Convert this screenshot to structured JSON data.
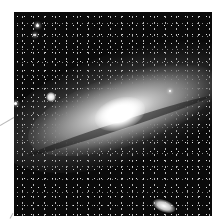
{
  "image": {
    "subject": "Andromeda galaxy (spiral galaxy with two satellite galaxies) on a star field",
    "colors": {
      "background": "#ffffff",
      "sky": "#0a0a0a",
      "core": "#ffffff",
      "pointer_line": "#b9b9b9"
    }
  }
}
